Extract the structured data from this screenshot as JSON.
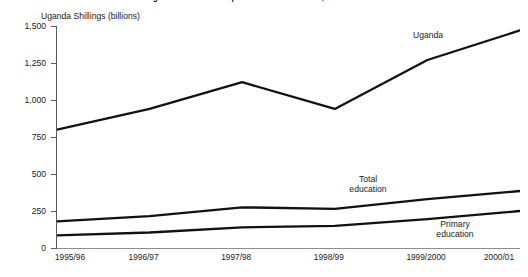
{
  "title": "Budget estimates for expenditure in education, 1995/96–2000/01",
  "axis_unit_label": "Uganda Shillings (billions)",
  "series_labels": {
    "uganda": "Uganda",
    "total_education_line1": "Total",
    "total_education_line2": "education",
    "primary_education_line1": "Primary",
    "primary_education_line2": "education"
  },
  "chart_data": {
    "type": "line",
    "title": "Budget estimates for expenditure in education, 1995/96–2000/01",
    "xlabel": "",
    "ylabel": "Uganda Shillings (billions)",
    "categories": [
      "1995/96",
      "1996/97",
      "1997/98",
      "1998/99",
      "1999/2000",
      "2000/01"
    ],
    "ytick_labels": [
      "0",
      "250",
      "500",
      "750",
      "1,000",
      "1,250",
      "1,500"
    ],
    "ytick_values": [
      0,
      250,
      500,
      750,
      1000,
      1250,
      1500
    ],
    "ylim": [
      0,
      1500
    ],
    "grid": false,
    "legend": "inline-annotations",
    "series": [
      {
        "name": "Uganda",
        "values": [
          800,
          940,
          1120,
          940,
          1270,
          1470
        ]
      },
      {
        "name": "Total education",
        "values": [
          180,
          215,
          275,
          265,
          330,
          385
        ]
      },
      {
        "name": "Primary education",
        "values": [
          85,
          105,
          140,
          150,
          195,
          250
        ]
      }
    ]
  }
}
